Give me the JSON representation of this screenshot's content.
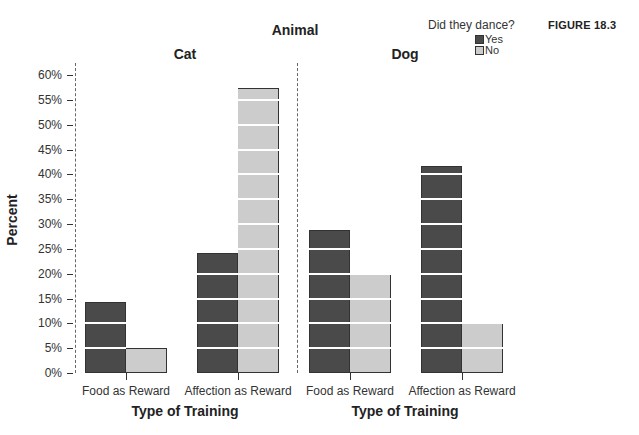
{
  "figure_label": "FIGURE 18.3",
  "legend": {
    "title": "Did they dance?",
    "items": [
      {
        "label": "Yes",
        "color": "#4a4a4a"
      },
      {
        "label": "No",
        "color": "#cccccc"
      }
    ]
  },
  "main_title": "Animal",
  "y_axis_title": "Percent",
  "y_ticks": [
    "0%",
    "5%",
    "10%",
    "15%",
    "20%",
    "25%",
    "30%",
    "35%",
    "40%",
    "45%",
    "50%",
    "55%",
    "60%"
  ],
  "panels": [
    {
      "title": "Cat",
      "x_axis_title": "Type of Training",
      "categories": [
        "Food as Reward",
        "Affection as Reward"
      ]
    },
    {
      "title": "Dog",
      "x_axis_title": "Type of Training",
      "categories": [
        "Food as Reward",
        "Affection as Reward"
      ]
    }
  ],
  "chart_data": {
    "type": "bar",
    "title": "Animal",
    "xlabel": "Type of Training",
    "ylabel": "Percent",
    "ylim": [
      0,
      60
    ],
    "y_tick_step": 5,
    "legend_title": "Did they dance?",
    "legend_position": "top-right",
    "grid": "white horizontal lines inside bars every 5%",
    "facets": [
      {
        "facet": "Cat",
        "categories": [
          "Food as Reward",
          "Affection as Reward"
        ],
        "series": [
          {
            "name": "Yes",
            "color": "#4a4a4a",
            "values": [
              14.3,
              24.1
            ]
          },
          {
            "name": "No",
            "color": "#cccccc",
            "values": [
              5.0,
              57.3
            ]
          }
        ]
      },
      {
        "facet": "Dog",
        "categories": [
          "Food as Reward",
          "Affection as Reward"
        ],
        "series": [
          {
            "name": "Yes",
            "color": "#4a4a4a",
            "values": [
              28.8,
              41.6
            ]
          },
          {
            "name": "No",
            "color": "#cccccc",
            "values": [
              20.1,
              10.1
            ]
          }
        ]
      }
    ]
  }
}
